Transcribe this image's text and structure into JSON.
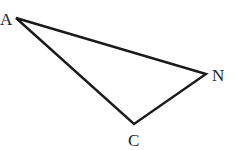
{
  "diagram": {
    "type": "triangle",
    "vertices": [
      {
        "label": "A",
        "x": 16,
        "y": 18
      },
      {
        "label": "N",
        "x": 206,
        "y": 74
      },
      {
        "label": "C",
        "x": 134,
        "y": 124
      }
    ],
    "stroke_color": "#1a1a1a"
  }
}
